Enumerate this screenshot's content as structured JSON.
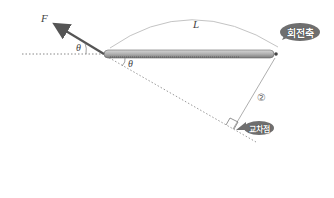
{
  "diagram": {
    "force_label": "F",
    "length_label": "L",
    "angle_label_top": "θ",
    "angle_label_bottom": "θ",
    "pivot_label": "회전축",
    "intersection_label": "교차점",
    "perpendicular_marker": "②",
    "colors": {
      "arrow": "#555555",
      "rod": "#9a9a9a",
      "bubble": "#6f6f6f",
      "dotted": "#888888",
      "arc": "#bbbbbb"
    }
  }
}
